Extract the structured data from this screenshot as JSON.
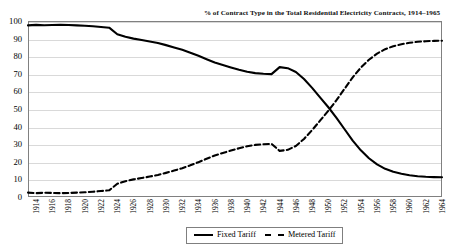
{
  "chart_data": {
    "type": "line",
    "title": "% of Contract Type in the Total Residential Electricity Contracts, 1914–1965",
    "xlabel": "",
    "ylabel": "",
    "ylim": [
      0,
      100
    ],
    "ytick_step": 10,
    "yticks": [
      0,
      10,
      20,
      30,
      40,
      50,
      60,
      70,
      80,
      90,
      100
    ],
    "xlim": [
      1914,
      1965
    ],
    "xticks": [
      1914,
      1916,
      1918,
      1920,
      1922,
      1924,
      1926,
      1928,
      1930,
      1932,
      1934,
      1936,
      1938,
      1940,
      1942,
      1944,
      1946,
      1948,
      1950,
      1952,
      1954,
      1956,
      1958,
      1960,
      1962,
      1964
    ],
    "grid": true,
    "legend_position": "bottom-center",
    "x": [
      1914,
      1915,
      1916,
      1917,
      1918,
      1919,
      1920,
      1921,
      1922,
      1923,
      1924,
      1925,
      1926,
      1927,
      1928,
      1929,
      1930,
      1931,
      1932,
      1933,
      1934,
      1935,
      1936,
      1937,
      1938,
      1939,
      1940,
      1941,
      1942,
      1943,
      1944,
      1945,
      1946,
      1947,
      1948,
      1949,
      1950,
      1951,
      1952,
      1953,
      1954,
      1955,
      1956,
      1957,
      1958,
      1959,
      1960,
      1961,
      1962,
      1963,
      1964,
      1965
    ],
    "series": [
      {
        "name": "Fixed Tariff",
        "style": "solid",
        "color": "#000000",
        "values": [
          97.5,
          97.8,
          97.6,
          97.7,
          97.8,
          97.7,
          97.5,
          97.3,
          97.0,
          96.6,
          96.2,
          92.5,
          91.0,
          90.0,
          89.2,
          88.4,
          87.5,
          86.3,
          85.0,
          83.6,
          82.0,
          80.2,
          78.3,
          76.4,
          75.0,
          73.6,
          72.3,
          71.2,
          70.4,
          70.0,
          69.8,
          73.8,
          73.2,
          71.0,
          67.0,
          62.0,
          56.5,
          51.0,
          45.0,
          38.5,
          32.0,
          26.5,
          22.0,
          18.5,
          16.0,
          14.3,
          13.2,
          12.4,
          11.8,
          11.5,
          11.3,
          11.2
        ]
      },
      {
        "name": "Metered Tariff",
        "style": "dashed",
        "color": "#000000",
        "values": [
          2.5,
          2.2,
          2.4,
          2.3,
          2.2,
          2.3,
          2.5,
          2.7,
          3.0,
          3.4,
          3.8,
          7.5,
          9.0,
          10.0,
          10.8,
          11.6,
          12.5,
          13.7,
          15.0,
          16.4,
          18.0,
          19.8,
          21.7,
          23.6,
          25.0,
          26.4,
          27.7,
          28.8,
          29.6,
          30.0,
          30.2,
          26.2,
          26.8,
          29.0,
          33.0,
          38.0,
          43.5,
          49.0,
          55.0,
          61.5,
          68.0,
          73.5,
          78.0,
          81.5,
          84.0,
          85.7,
          86.8,
          87.6,
          88.2,
          88.5,
          88.7,
          88.8
        ]
      }
    ]
  },
  "legend": {
    "items": [
      {
        "label": "Fixed Tariff",
        "style": "solid"
      },
      {
        "label": "Metered Tariff",
        "style": "dashed"
      }
    ]
  }
}
